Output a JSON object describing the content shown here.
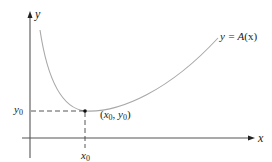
{
  "figure": {
    "axes": {
      "x_label": "x",
      "y_label": "y"
    },
    "curve": {
      "label_lhs": "y = ",
      "label_func": "A",
      "label_arg": "(x)"
    },
    "minimum_point": {
      "label_open": "(",
      "x_var": "x",
      "x_sub": "0",
      "comma": ", ",
      "y_var": "y",
      "y_sub": "0",
      "label_close": ")"
    },
    "ticks": {
      "x0_var": "x",
      "x0_sub": "0",
      "y0_var": "y",
      "y0_sub": "0"
    },
    "colors": {
      "axis": "#555555",
      "curve": "#a8a8a8",
      "dashed": "#444444",
      "point": "#111111"
    }
  }
}
